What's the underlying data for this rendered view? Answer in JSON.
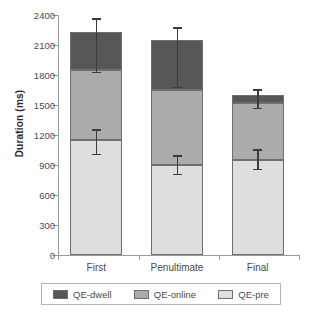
{
  "chart_data": {
    "type": "bar",
    "subtype": "stacked-bar",
    "title": "",
    "xlabel": "",
    "ylabel": "Duration (ms)",
    "ylim": [
      0,
      2400
    ],
    "yticks": [
      0,
      300,
      600,
      900,
      1200,
      1500,
      1800,
      2100,
      2400
    ],
    "ytick_labels": [
      "0",
      "300",
      "600",
      "900",
      "1200",
      "1500",
      "1800",
      "2100",
      "2400"
    ],
    "grid": false,
    "legend_position": "bottom",
    "categories": [
      "First",
      "Penultimate",
      "Final"
    ],
    "series": [
      {
        "name": "QE-pre",
        "color": "#dedede",
        "values": [
          1150,
          900,
          950
        ]
      },
      {
        "name": "QE-online",
        "color": "#ababab",
        "values": [
          700,
          750,
          570
        ]
      },
      {
        "name": "QE-dwell",
        "color": "#575757",
        "values": [
          380,
          500,
          80
        ]
      }
    ],
    "stack_order_bottom_to_top": [
      "QE-pre",
      "QE-online",
      "QE-dwell"
    ],
    "cumulative_tops": [
      {
        "category": "First",
        "pre_top": 1150,
        "online_top": 1850,
        "dwell_top": 2230
      },
      {
        "category": "Penultimate",
        "pre_top": 900,
        "online_top": 1650,
        "dwell_top": 2150
      },
      {
        "category": "Final",
        "pre_top": 950,
        "online_top": 1520,
        "dwell_top": 1600
      }
    ],
    "error_bars": [
      {
        "category": "First",
        "at": "total",
        "value": 2230,
        "low": 1820,
        "high": 2370
      },
      {
        "category": "First",
        "at": "QE-pre",
        "value": 1150,
        "low": 1000,
        "high": 1260
      },
      {
        "category": "Penultimate",
        "at": "total",
        "value": 2150,
        "low": 1670,
        "high": 2280
      },
      {
        "category": "Penultimate",
        "at": "QE-pre",
        "value": 900,
        "low": 800,
        "high": 1000
      },
      {
        "category": "Final",
        "at": "total",
        "value": 1600,
        "low": 1460,
        "high": 1660
      },
      {
        "category": "Final",
        "at": "QE-pre",
        "value": 950,
        "low": 850,
        "high": 1060
      }
    ]
  },
  "legend": {
    "items": [
      {
        "label": "QE-dwell",
        "color": "#575757"
      },
      {
        "label": "QE-online",
        "color": "#ababab"
      },
      {
        "label": "QE-pre",
        "color": "#dedede"
      }
    ]
  }
}
